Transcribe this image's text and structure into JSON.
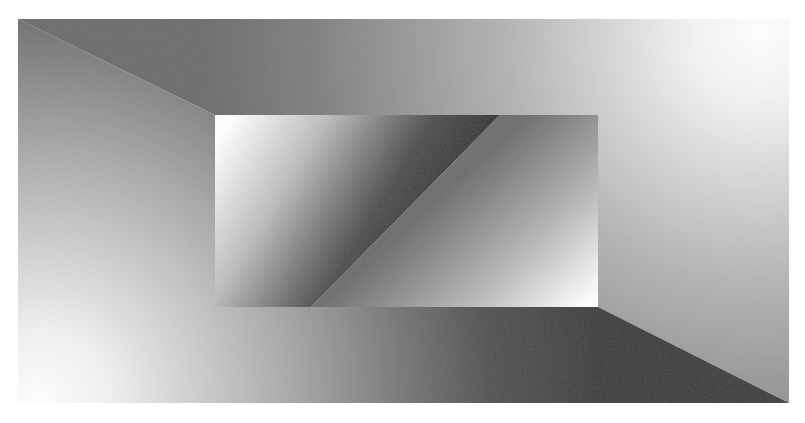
{
  "figure": {
    "kind": "abstract-geometric-illusion",
    "background": "#ffffff",
    "outer_rect": {
      "x": 18,
      "y": 19,
      "width": 771,
      "height": 384
    },
    "inner_rect": {
      "x": 215,
      "y": 115,
      "width": 383,
      "height": 192
    },
    "colors": {
      "white": "#ffffff",
      "light": "#d8d8d8",
      "mid": "#8c8c8c",
      "mid_dark": "#6e6e6e",
      "dark": "#3a3a3a",
      "darkest": "#2a2a2a"
    }
  }
}
